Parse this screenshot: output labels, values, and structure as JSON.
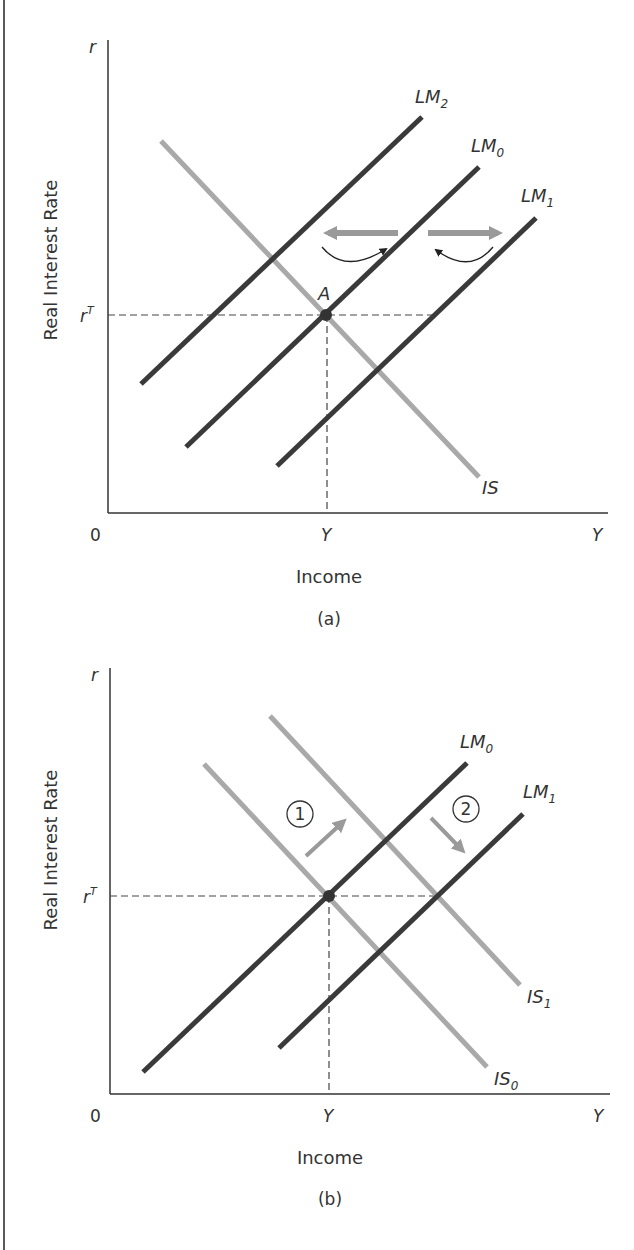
{
  "figure": {
    "border_color": "#5a5a5a",
    "colors": {
      "lm_curve": "#3a3a3a",
      "is_curve": "#a9a9a9",
      "axis": "#333333",
      "dashed": "#444444",
      "shift_arrow": "#9a9a9a",
      "curved_arrow": "#222222",
      "text": "#333333"
    }
  },
  "panels": [
    {
      "id": "a",
      "caption": "(a)",
      "y_axis_symbol": "r",
      "y_axis_title": "Real Interest Rate",
      "x_axis_title": "Income",
      "origin_label": "0",
      "x_axis_end_label": "Y",
      "y_target_label": "r",
      "y_target_sup": "T",
      "x_potential_label": "Y",
      "point_label": "A",
      "curves": [
        {
          "name": "LM2",
          "base": "LM",
          "sub": "2",
          "type": "LM"
        },
        {
          "name": "LM0",
          "base": "LM",
          "sub": "0",
          "type": "LM"
        },
        {
          "name": "LM1",
          "base": "LM",
          "sub": "1",
          "type": "LM"
        },
        {
          "name": "IS",
          "base": "IS",
          "sub": "",
          "type": "IS"
        }
      ],
      "annotations": [
        "leftward shift arrow LM0 to LM2",
        "rightward shift arrow LM0 to LM1"
      ]
    },
    {
      "id": "b",
      "caption": "(b)",
      "y_axis_symbol": "r",
      "y_axis_title": "Real Interest Rate",
      "x_axis_title": "Income",
      "origin_label": "0",
      "x_axis_end_label": "Y",
      "y_target_label": "r",
      "y_target_sup": "T",
      "x_potential_label": "Y",
      "curves": [
        {
          "name": "LM0",
          "base": "LM",
          "sub": "0",
          "type": "LM"
        },
        {
          "name": "LM1",
          "base": "LM",
          "sub": "1",
          "type": "LM"
        },
        {
          "name": "IS1",
          "base": "IS",
          "sub": "1",
          "type": "IS"
        },
        {
          "name": "IS0",
          "base": "IS",
          "sub": "0",
          "type": "IS"
        }
      ],
      "steps": [
        {
          "number": "1",
          "description": "IS shifts up/right from IS0 to IS1"
        },
        {
          "number": "2",
          "description": "LM shifts down/right from LM0 to LM1"
        }
      ]
    }
  ]
}
